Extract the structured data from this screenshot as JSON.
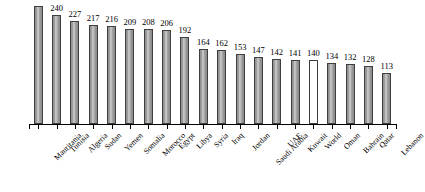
{
  "chart_data": {
    "type": "bar",
    "title": "",
    "subtitle": "",
    "xlabel": "",
    "ylabel": "",
    "grid": false,
    "legend": "none",
    "ylim": [
      0,
      270
    ],
    "note": "Top value label of the first bar is clipped by the top edge of the image.",
    "categories": [
      "Mauritania",
      "Tunisia",
      "Algeria",
      "Sudan",
      "Yemen",
      "Somalia",
      "Morocco",
      "Egypt",
      "Libya",
      "Syria",
      "Iraq",
      "Jordan",
      "Saudi Arabia",
      "UAE",
      "Kuwait",
      "World",
      "Oman",
      "Bahrain",
      "Qatar",
      "Lebanon"
    ],
    "values": [
      260,
      240,
      227,
      217,
      216,
      209,
      208,
      206,
      192,
      164,
      162,
      153,
      147,
      142,
      141,
      140,
      134,
      132,
      128,
      113
    ],
    "value_labels": [
      "",
      "240",
      "227",
      "217",
      "216",
      "209",
      "208",
      "206",
      "192",
      "164",
      "162",
      "153",
      "147",
      "142",
      "141",
      "140",
      "134",
      "132",
      "128",
      "113"
    ],
    "highlight_category": "World",
    "highlight_style": "hollow-white-bar",
    "colors": {
      "bar_fill": "#9a9a9a",
      "bar_highlight_stripe": "#cdcdcd",
      "bar_border": "#3f3f3f",
      "highlight_bar_fill": "#ffffff",
      "axis": "#000000",
      "text": "#000000",
      "background": "#ffffff"
    }
  }
}
